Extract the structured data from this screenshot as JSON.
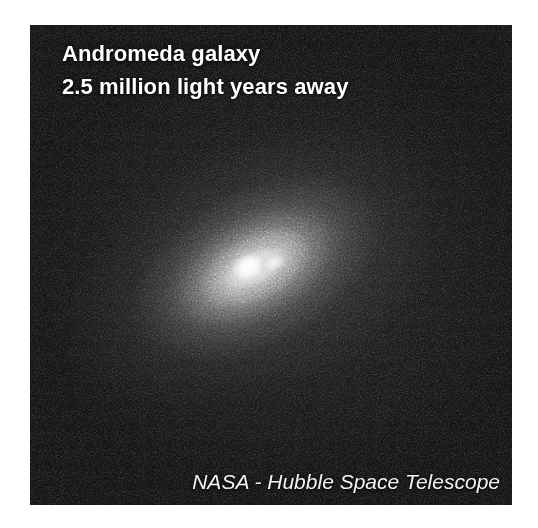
{
  "page": {
    "background_color": "#ffffff",
    "width": 538,
    "height": 528
  },
  "photo": {
    "alt_name": "andromeda-galaxy-hubble-photograph",
    "plate_background_color": "#141414",
    "plate_bounds": {
      "x": 30,
      "y": 25,
      "width": 482,
      "height": 480
    }
  },
  "caption": {
    "title_line_1": "Andromeda galaxy",
    "title_line_2": "2.5 million light years away",
    "title_color": "#ffffff"
  },
  "credit": {
    "text": "NASA - Hubble Space Telescope",
    "color": "#f2f2f2"
  },
  "subject": {
    "name": "Andromeda galaxy",
    "distance": "2.5 million light years away",
    "instrument": "Hubble Space Telescope",
    "agency": "NASA",
    "features": [
      {
        "name": "galaxy-core-primary",
        "description": "bright primary nucleus"
      },
      {
        "name": "galaxy-core-secondary",
        "description": "fainter secondary nucleus knot"
      },
      {
        "name": "galaxy-halo",
        "description": "elongated elliptical bulge halo"
      },
      {
        "name": "background-noise",
        "description": "grainy dark sky background"
      }
    ]
  }
}
